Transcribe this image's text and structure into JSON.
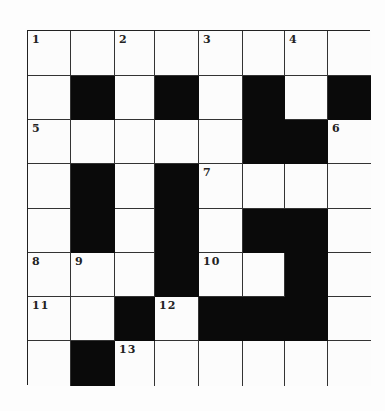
{
  "puzzle": {
    "rows": 8,
    "cols": 8,
    "col_edges": [
      0,
      43,
      87,
      127,
      171,
      215,
      257,
      300,
      343
    ],
    "row_edges": [
      0,
      45,
      89,
      133,
      178,
      222,
      266,
      310,
      355
    ],
    "grid": [
      [
        "1",
        "",
        "2",
        "",
        "3",
        "",
        "4",
        ""
      ],
      [
        "",
        "#",
        "",
        "#",
        "",
        "#",
        "",
        "#"
      ],
      [
        "5",
        "",
        "",
        "",
        "",
        "#",
        "#",
        "6"
      ],
      [
        "",
        "#",
        "",
        "#",
        "7",
        "",
        "",
        ""
      ],
      [
        "",
        "#",
        "",
        "#",
        "",
        "#",
        "#",
        ""
      ],
      [
        "8",
        "9",
        "",
        "#",
        "10",
        "",
        "#",
        ""
      ],
      [
        "11",
        "",
        "#",
        "12",
        "#",
        "#",
        "#",
        ""
      ],
      [
        "",
        "#",
        "13",
        "",
        "",
        "",
        "",
        ""
      ]
    ],
    "clue_numbers": [
      "1",
      "2",
      "3",
      "4",
      "5",
      "6",
      "7",
      "8",
      "9",
      "10",
      "11",
      "12",
      "13"
    ]
  }
}
